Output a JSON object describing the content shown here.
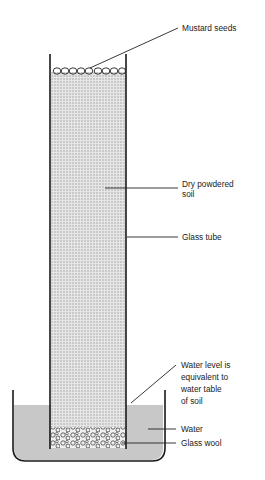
{
  "diagram": {
    "labels": {
      "mustard_seeds": "Mustard seeds",
      "dry_soil_line1": "Dry powdered",
      "dry_soil_line2": "soil",
      "glass_tube": "Glass tube",
      "water_level_line1": "Water level is",
      "water_level_line2": "equivalent to",
      "water_level_line3": "water table",
      "water_level_line4": "of soil",
      "water": "Water",
      "glass_wool": "Glass wool"
    },
    "colors": {
      "soil_fill": "#d9d9d9",
      "water_fill": "#c8c8c8",
      "outline": "#1a1a1a"
    }
  }
}
